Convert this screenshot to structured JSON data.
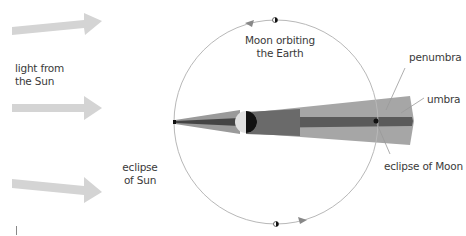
{
  "diagram": {
    "type": "lunar and solar eclipse geometry",
    "labels": {
      "light_from_sun": [
        "light from",
        "the Sun"
      ],
      "moon_orbiting": [
        "Moon orbiting",
        "the Earth"
      ],
      "penumbra": "penumbra",
      "umbra": "umbra",
      "eclipse_of_sun": [
        "eclipse",
        "of Sun"
      ],
      "eclipse_of_moon": "eclipse of Moon"
    },
    "colors": {
      "arrow": "#d4d4d4",
      "orbit": "#b8b8b8",
      "penumbra": "#a6a6a6",
      "umbra": "#5a5a5a",
      "earth_lit": "#e0e0e0",
      "earth_dark": "#111111",
      "moon": "#111111",
      "leader": "#999999",
      "text": "#3a3a3a"
    },
    "elements": {
      "sun_arrows": 3,
      "orbit_direction": "counter-clockwise",
      "moon_positions": [
        "top",
        "left (eclipse of Sun)",
        "bottom",
        "right (eclipse of Moon)"
      ]
    }
  }
}
